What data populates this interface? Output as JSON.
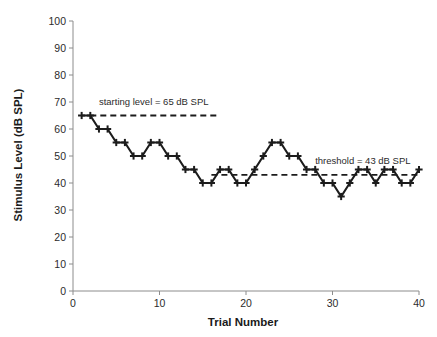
{
  "chart_data": {
    "type": "line",
    "title": "",
    "xlabel": "Trial Number",
    "ylabel": "Stimulus Level (dB SPL)",
    "xlim": [
      0,
      40
    ],
    "ylim": [
      0,
      100
    ],
    "xticks": [
      0,
      10,
      20,
      30,
      40
    ],
    "yticks": [
      0,
      10,
      20,
      30,
      40,
      50,
      60,
      70,
      80,
      90,
      100
    ],
    "grid": false,
    "legend": "none",
    "marker": "plus",
    "line_color": "#1c1c1c",
    "x": [
      1,
      2,
      3,
      4,
      5,
      6,
      7,
      8,
      9,
      10,
      11,
      12,
      13,
      14,
      15,
      16,
      17,
      18,
      19,
      20,
      21,
      22,
      23,
      24,
      25,
      26,
      27,
      28,
      29,
      30,
      31,
      32,
      33,
      34,
      35,
      36,
      37,
      38,
      39,
      40
    ],
    "values": [
      65,
      65,
      60,
      60,
      55,
      55,
      50,
      50,
      55,
      55,
      50,
      50,
      45,
      45,
      40,
      40,
      45,
      45,
      40,
      40,
      45,
      50,
      55,
      55,
      50,
      50,
      45,
      45,
      40,
      40,
      35,
      40,
      45,
      45,
      40,
      45,
      45,
      40,
      40,
      45
    ],
    "series": [
      {
        "name": "Adaptive staircase track",
        "values": [
          65,
          65,
          60,
          60,
          55,
          55,
          50,
          50,
          55,
          55,
          50,
          50,
          45,
          45,
          40,
          40,
          45,
          45,
          40,
          40,
          45,
          50,
          55,
          55,
          50,
          50,
          45,
          45,
          40,
          40,
          35,
          40,
          45,
          45,
          40,
          45,
          45,
          40,
          40,
          45
        ]
      }
    ],
    "annotations": [
      {
        "id": "starting-level",
        "text": "starting level = 65 dB SPL",
        "value": 65,
        "unit": "dB SPL",
        "line_x_start": 2,
        "line_x_end": 17,
        "label_x": 3,
        "label_y": 69,
        "style": "dashed"
      },
      {
        "id": "threshold",
        "text": "threshold = 43 dB SPL",
        "value": 43,
        "unit": "dB SPL",
        "line_x_start": 16,
        "line_x_end": 40,
        "label_x": 28,
        "label_y": 47,
        "style": "dashed"
      }
    ]
  },
  "axes": {
    "x_title": "Trial Number",
    "y_title": "Stimulus Level (dB SPL)",
    "x_tick_labels": [
      "0",
      "10",
      "20",
      "30",
      "40"
    ],
    "y_tick_labels": [
      "0",
      "10",
      "20",
      "30",
      "40",
      "50",
      "60",
      "70",
      "80",
      "90",
      "100"
    ]
  },
  "annotation_labels": {
    "starting_level": "starting level = 65 dB SPL",
    "threshold": "threshold = 43 dB SPL"
  },
  "colors": {
    "line": "#1c1c1c",
    "axis": "#8c8c8c",
    "text": "#2b2b2b",
    "background": "#ffffff"
  }
}
